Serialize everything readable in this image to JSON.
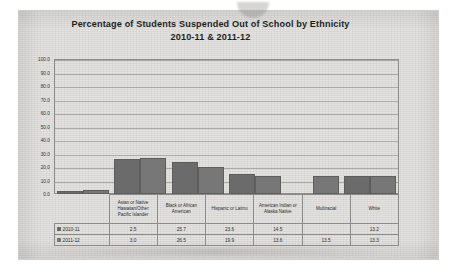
{
  "chart_data": {
    "type": "bar",
    "title": "Percentage of Students Suspended Out of School by Ethnicity",
    "subtitle": "2010-11 & 2011-12",
    "xlabel": "",
    "ylabel": "",
    "ylim": [
      0.0,
      100.0
    ],
    "ytick_step": 10.0,
    "ytick_labels": [
      "100.0",
      "90.0",
      "80.0",
      "70.0",
      "60.0",
      "50.0",
      "40.0",
      "30.0",
      "20.0",
      "10.0",
      "0.0"
    ],
    "grid": true,
    "legend_position": "data-table-left",
    "categories": [
      "Asian or Native Hawaiian/Other Pacific Islander",
      "Black or African American",
      "Hispanic or Latino",
      "American Indian or Alaska Native",
      "Multiracial",
      "White"
    ],
    "series": [
      {
        "name": "2010-11",
        "color": "#6b6b6b",
        "values": [
          2.5,
          25.7,
          23.6,
          14.5,
          null,
          13.2
        ],
        "value_labels": [
          "2.5",
          "25.7",
          "23.6",
          "14.5",
          "",
          "13.2"
        ]
      },
      {
        "name": "2011-12",
        "color": "#777777",
        "values": [
          3.0,
          26.5,
          19.9,
          13.6,
          13.5,
          13.3
        ],
        "value_labels": [
          "3.0",
          "26.5",
          "19.9",
          "13.6",
          "13.5",
          "13.3"
        ]
      }
    ]
  },
  "colors": {
    "page": "#d9d7d4",
    "axis": "#8b8b88",
    "gridline": "#a9a9a5",
    "text": "#2b2b2b",
    "series_2010": "#6b6b6b",
    "series_2011": "#777777"
  }
}
